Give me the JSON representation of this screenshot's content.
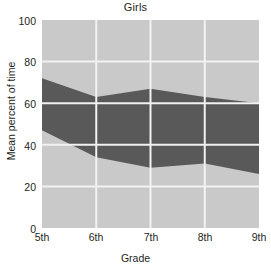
{
  "chart_data": {
    "type": "area",
    "title": "Girls",
    "xlabel": "Grade",
    "ylabel": "Mean percent of time",
    "categories": [
      "5th",
      "6th",
      "7th",
      "8th",
      "9th"
    ],
    "x_tick_labels": [
      "5th",
      "6th",
      "7th",
      "8th",
      "9th"
    ],
    "y_tick_labels": [
      "0",
      "20",
      "40",
      "60",
      "80",
      "100"
    ],
    "y_tick_values": [
      0,
      20,
      40,
      60,
      80,
      100
    ],
    "ylim": [
      0,
      100
    ],
    "grid": true,
    "legend": "none",
    "series": [
      {
        "name": "lower-band",
        "color": "#c9c9c9",
        "values": [
          47,
          34,
          29,
          31,
          26
        ]
      },
      {
        "name": "middle-band",
        "color": "#595959",
        "values": [
          25,
          29,
          38,
          32,
          34
        ]
      },
      {
        "name": "upper-band",
        "color": "#c9c9c9",
        "values": [
          28,
          37,
          33,
          37,
          40
        ]
      }
    ],
    "boundaries": {
      "middle_band_lower": [
        47,
        34,
        29,
        31,
        26
      ],
      "middle_band_upper": [
        72,
        63,
        67,
        63,
        60
      ]
    },
    "colors": {
      "light_band": "#c9c9c9",
      "dark_band": "#595959",
      "gridline": "#f2f2f2",
      "text": "#231f20",
      "background": "#ffffff"
    }
  }
}
